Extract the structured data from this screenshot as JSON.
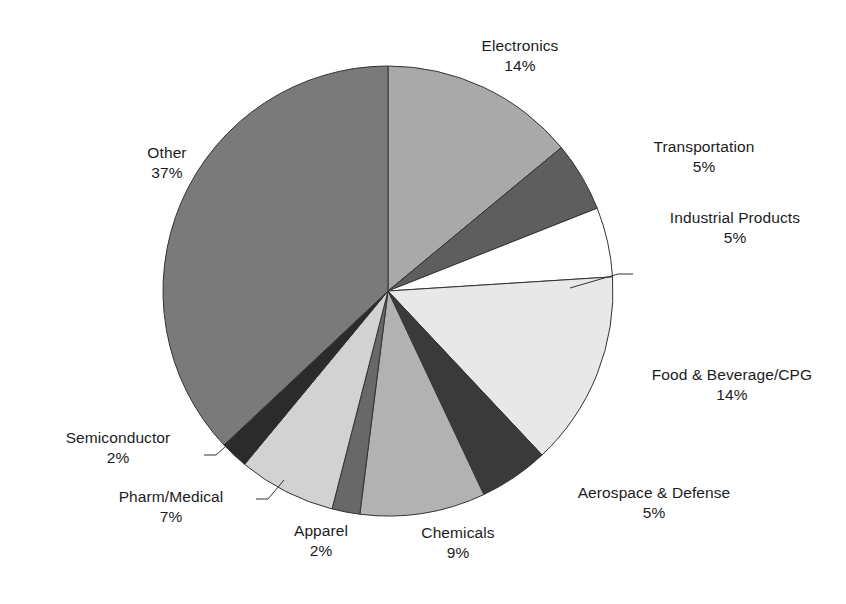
{
  "chart_data": {
    "type": "pie",
    "title": "",
    "subtitle": "",
    "xlabel": "",
    "ylabel": "",
    "legend_position": "none",
    "grid": false,
    "start_angle_deg": 0,
    "direction": "clockwise",
    "labels_show_percent": true,
    "categories": [
      "Electronics",
      "Transportation",
      "Industrial Products",
      "Food & Beverage/CPG",
      "Aerospace & Defense",
      "Chemicals",
      "Apparel",
      "Pharm/Medical",
      "Semiconductor",
      "Other"
    ],
    "values": [
      14,
      5,
      5,
      14,
      5,
      9,
      2,
      7,
      2,
      37
    ],
    "value_labels": [
      "14%",
      "5%",
      "5%",
      "14%",
      "5%",
      "9%",
      "2%",
      "7%",
      "2%",
      "37%"
    ],
    "colors": [
      "#a9a9a9",
      "#5e5e5e",
      "#ffffff",
      "#e8e8e8",
      "#3a3a3a",
      "#b2b2b2",
      "#686868",
      "#d2d2d2",
      "#2b2b2b",
      "#7a7a7a"
    ],
    "slices": [
      {
        "name": "Electronics",
        "value": 14,
        "value_label": "14%",
        "color": "#a9a9a9",
        "leader_line": false
      },
      {
        "name": "Transportation",
        "value": 5,
        "value_label": "5%",
        "color": "#5e5e5e",
        "leader_line": false
      },
      {
        "name": "Industrial Products",
        "value": 5,
        "value_label": "5%",
        "color": "#ffffff",
        "leader_line": true
      },
      {
        "name": "Food & Beverage/CPG",
        "value": 14,
        "value_label": "14%",
        "color": "#e8e8e8",
        "leader_line": false
      },
      {
        "name": "Aerospace & Defense",
        "value": 5,
        "value_label": "5%",
        "color": "#3a3a3a",
        "leader_line": false
      },
      {
        "name": "Chemicals",
        "value": 9,
        "value_label": "9%",
        "color": "#b2b2b2",
        "leader_line": false
      },
      {
        "name": "Apparel",
        "value": 2,
        "value_label": "2%",
        "color": "#686868",
        "leader_line": false
      },
      {
        "name": "Pharm/Medical",
        "value": 7,
        "value_label": "7%",
        "color": "#d2d2d2",
        "leader_line": true
      },
      {
        "name": "Semiconductor",
        "value": 2,
        "value_label": "2%",
        "color": "#2b2b2b",
        "leader_line": true
      },
      {
        "name": "Other",
        "value": 37,
        "value_label": "37%",
        "color": "#7a7a7a",
        "leader_line": false
      }
    ],
    "total": 100,
    "units": "percent"
  },
  "labels": {
    "electronics": {
      "name": "Electronics",
      "value": "14%"
    },
    "transportation": {
      "name": "Transportation",
      "value": "5%"
    },
    "industrial": {
      "name": "Industrial Products",
      "value": "5%"
    },
    "food": {
      "name": "Food & Beverage/CPG",
      "value": "14%"
    },
    "aerospace": {
      "name": "Aerospace & Defense",
      "value": "5%"
    },
    "chemicals": {
      "name": "Chemicals",
      "value": "9%"
    },
    "apparel": {
      "name": "Apparel",
      "value": "2%"
    },
    "pharm": {
      "name": "Pharm/Medical",
      "value": "7%"
    },
    "semiconductor": {
      "name": "Semiconductor",
      "value": "2%"
    },
    "other": {
      "name": "Other",
      "value": "37%"
    }
  },
  "geometry": {
    "center_x": 388,
    "center_y": 291,
    "radius": 225
  },
  "style": {
    "background": "#ffffff",
    "outline": "#333333",
    "text": "#1c1c1c"
  }
}
